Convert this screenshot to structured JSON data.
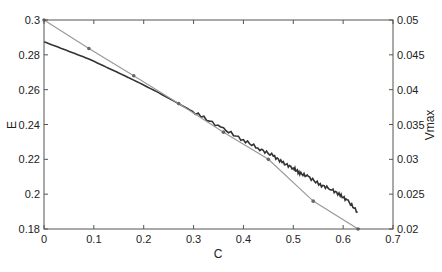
{
  "chart_data": {
    "type": "line",
    "title": "",
    "xlabel": "C",
    "ylabel": "E",
    "ylabel_right": "Vmax",
    "xlim": [
      0,
      0.7
    ],
    "ylim": [
      0.18,
      0.3
    ],
    "ylim_right": [
      0.02,
      0.05
    ],
    "grid": false,
    "legend": null,
    "x_ticks": [
      "0",
      "0.1",
      "0.2",
      "0.3",
      "0.4",
      "0.5",
      "0.6",
      "0.7"
    ],
    "y_ticks": [
      "0.18",
      "0.2",
      "0.22",
      "0.24",
      "0.26",
      "0.28",
      "0.3"
    ],
    "y_ticks_right": [
      "0.02",
      "0.025",
      "0.03",
      "0.035",
      "0.04",
      "0.045",
      "0.05"
    ],
    "series": [
      {
        "name": "E",
        "axis": "left",
        "color": "#333333",
        "style": "solid-noisy",
        "x": [
          0,
          0.045,
          0.09,
          0.135,
          0.18,
          0.225,
          0.27,
          0.315,
          0.36,
          0.4,
          0.433,
          0.46,
          0.48,
          0.5,
          0.513,
          0.53,
          0.554,
          0.575,
          0.594,
          0.61,
          0.629
        ],
        "y": [
          0.2875,
          0.2826,
          0.2776,
          0.2716,
          0.2655,
          0.259,
          0.252,
          0.2448,
          0.2374,
          0.231,
          0.2259,
          0.222,
          0.2178,
          0.215,
          0.2121,
          0.21,
          0.2053,
          0.203,
          0.1995,
          0.196,
          0.1898
        ]
      },
      {
        "name": "Vmax",
        "axis": "right",
        "color": "#9a9a9a",
        "style": "line-with-markers",
        "x": [
          0,
          0.09,
          0.18,
          0.27,
          0.36,
          0.45,
          0.54,
          0.63
        ],
        "y": [
          0.05,
          0.0459,
          0.042,
          0.038,
          0.0339,
          0.03,
          0.024,
          0.02
        ]
      }
    ]
  }
}
